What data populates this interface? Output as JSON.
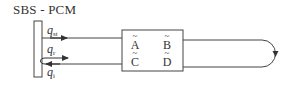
{
  "title": "SBS - PCM",
  "signals": {
    "q_st": {
      "base": "q",
      "sub": "st"
    },
    "q_r": {
      "base": "q",
      "sub": "r"
    },
    "q_i": {
      "base": "q",
      "sub": "i"
    }
  },
  "box": {
    "cells": [
      {
        "tilde": "~",
        "letter": "A"
      },
      {
        "tilde": "~",
        "letter": "B"
      },
      {
        "tilde": "~",
        "letter": "C"
      },
      {
        "tilde": "~",
        "letter": "D"
      }
    ]
  },
  "colors": {
    "line": "#444444",
    "text": "#333333",
    "background": "#ffffff"
  }
}
